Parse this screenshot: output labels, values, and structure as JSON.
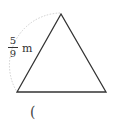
{
  "figure": {
    "shape": "equilateral-triangle",
    "side_label": {
      "numerator": "5",
      "denominator": "9",
      "unit": "m"
    },
    "answer_paren": "(",
    "colors": {
      "stroke": "#333333",
      "arc": "#cccccc"
    }
  }
}
